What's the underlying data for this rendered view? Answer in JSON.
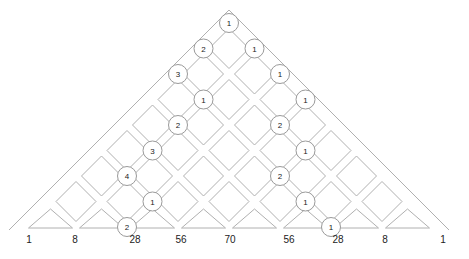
{
  "diagram": {
    "type": "pascal-lattice-paths",
    "rows": 8,
    "apex": [
      229,
      23
    ],
    "step": 25.5,
    "line_color": "#b0b0b0",
    "circle_stroke": "#9a9a9a",
    "text_color": "#222222",
    "circles": [
      {
        "r": 0,
        "k": 0,
        "label": "1"
      },
      {
        "r": 1,
        "k": 0,
        "label": "2"
      },
      {
        "r": 1,
        "k": 1,
        "label": "1"
      },
      {
        "r": 2,
        "k": 0,
        "label": "3"
      },
      {
        "r": 2,
        "k": 2,
        "label": "1"
      },
      {
        "r": 3,
        "k": 1,
        "label": "1"
      },
      {
        "r": 3,
        "k": 3,
        "label": "1"
      },
      {
        "r": 4,
        "k": 1,
        "label": "2"
      },
      {
        "r": 4,
        "k": 3,
        "label": "2"
      },
      {
        "r": 5,
        "k": 1,
        "label": "3"
      },
      {
        "r": 5,
        "k": 4,
        "label": "1"
      },
      {
        "r": 6,
        "k": 1,
        "label": "4"
      },
      {
        "r": 6,
        "k": 4,
        "label": "2"
      },
      {
        "r": 7,
        "k": 2,
        "label": "1"
      },
      {
        "r": 7,
        "k": 5,
        "label": "1"
      },
      {
        "r": 8,
        "k": 2,
        "label": "2"
      },
      {
        "r": 8,
        "k": 6,
        "label": "1"
      }
    ],
    "bottom_labels": [
      {
        "x": 29,
        "text": "1"
      },
      {
        "x": 75,
        "text": "8"
      },
      {
        "x": 135,
        "text": "28"
      },
      {
        "x": 181,
        "text": "56"
      },
      {
        "x": 230,
        "text": "70"
      },
      {
        "x": 289,
        "text": "56"
      },
      {
        "x": 338,
        "text": "28"
      },
      {
        "x": 385,
        "text": "8"
      },
      {
        "x": 443,
        "text": "1"
      }
    ]
  }
}
